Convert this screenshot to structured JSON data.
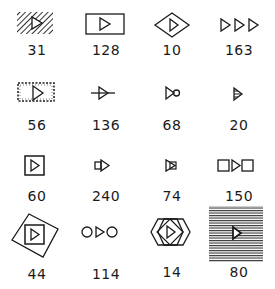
{
  "figure": {
    "items": [
      {
        "label": "31",
        "symbol": "hatched-diagonal-rect-with-triangle-icon"
      },
      {
        "label": "128",
        "symbol": "rectangle-with-triangle-icon"
      },
      {
        "label": "10",
        "symbol": "diamond-with-triangle-icon"
      },
      {
        "label": "163",
        "symbol": "three-triangles-icon"
      },
      {
        "label": "56",
        "symbol": "dashed-rect-with-triangle-icon"
      },
      {
        "label": "136",
        "symbol": "triangle-on-line-icon"
      },
      {
        "label": "68",
        "symbol": "triangle-with-circle-icon"
      },
      {
        "label": "20",
        "symbol": "striped-triangle-icon"
      },
      {
        "label": "60",
        "symbol": "square-with-triangle-icon"
      },
      {
        "label": "240",
        "symbol": "small-square-triangle-icon"
      },
      {
        "label": "74",
        "symbol": "triangle-with-square-icon"
      },
      {
        "label": "150",
        "symbol": "square-triangle-square-icon"
      },
      {
        "label": "44",
        "symbol": "rotated-square-with-square-triangle-icon"
      },
      {
        "label": "114",
        "symbol": "circle-triangle-circle-icon"
      },
      {
        "label": "14",
        "symbol": "overlapping-hexagons-with-triangle-icon"
      },
      {
        "label": "80",
        "symbol": "horizontal-striped-square-with-triangle-icon"
      }
    ]
  },
  "colors": {
    "ink": "#1a1a1a",
    "background": "#ffffff"
  }
}
